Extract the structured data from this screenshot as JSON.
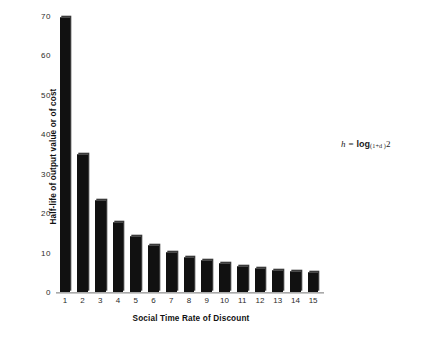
{
  "chart_data": {
    "type": "bar",
    "title": "",
    "xlabel": "Social Time Rate of Discount",
    "ylabel": "Half-life of output value or of cost",
    "categories": [
      "1",
      "2",
      "3",
      "4",
      "5",
      "6",
      "7",
      "8",
      "9",
      "10",
      "11",
      "12",
      "13",
      "14",
      "15"
    ],
    "values": [
      69.7,
      35.0,
      23.4,
      17.7,
      14.2,
      11.9,
      10.2,
      9.0,
      8.0,
      7.3,
      6.6,
      6.1,
      5.7,
      5.3,
      5.0
    ],
    "ylim": [
      0,
      70
    ],
    "yticks": [
      0,
      10,
      20,
      30,
      40,
      50,
      60,
      70
    ],
    "ytick_labels": [
      "0",
      "10",
      "20",
      "30",
      "40",
      "50",
      "60",
      "70"
    ],
    "grid": false,
    "legend": "none",
    "bar_color": "#111111",
    "annotation": {
      "variable": "h",
      "equals": "=",
      "function": "log",
      "base": "(1+d )",
      "argument": "2",
      "full_text": "h = log(1+d)2"
    }
  }
}
